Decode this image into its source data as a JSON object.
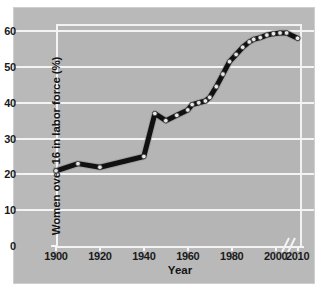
{
  "chart_data": {
    "type": "line",
    "title": "",
    "xlabel": "Year",
    "ylabel": "Women over 16 in labor force (%)",
    "xlim": [
      1900,
      2012
    ],
    "ylim": [
      0,
      62
    ],
    "xticks": [
      1900,
      1920,
      1940,
      1960,
      1980,
      2000,
      2010
    ],
    "xtick_labels": [
      "1900",
      "1920",
      "1940",
      "1960",
      "1980",
      "2000",
      "2010"
    ],
    "yticks": [
      0,
      10,
      20,
      30,
      40,
      50,
      60
    ],
    "ytick_labels": [
      "0",
      "10",
      "20",
      "30",
      "40",
      "50",
      "60"
    ],
    "grid": "horizontal",
    "legend": "none",
    "axis_break": {
      "present": true,
      "axis": "x",
      "near": 2006
    },
    "line_color": "#111111",
    "marker_color": "#e8e8e8",
    "plot_background": "#b5b5b5",
    "gridline_color": "#f4f4f4",
    "series": [
      {
        "name": "Women over 16 in labor force",
        "x": [
          1900,
          1910,
          1920,
          1940,
          1945,
          1950,
          1955,
          1960,
          1962,
          1965,
          1968,
          1970,
          1973,
          1976,
          1979,
          1982,
          1985,
          1988,
          1990,
          1993,
          1996,
          1999,
          2002,
          2005,
          2010
        ],
        "values": [
          21.0,
          23.0,
          22.0,
          25.0,
          37.0,
          35.0,
          36.5,
          38.0,
          39.5,
          40.0,
          40.5,
          41.5,
          44.5,
          48.0,
          51.5,
          53.5,
          55.5,
          57.0,
          57.7,
          58.2,
          58.9,
          59.3,
          59.5,
          59.5,
          58.0
        ]
      }
    ]
  }
}
